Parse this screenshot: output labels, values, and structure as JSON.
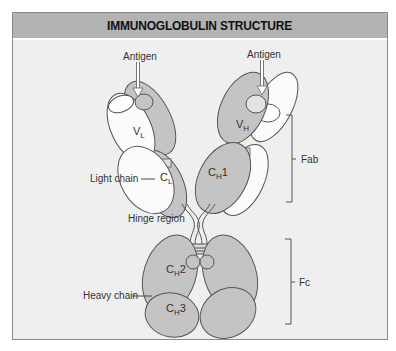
{
  "title": "IMMUNOGLOBULIN STRUCTURE",
  "labels": {
    "antigen_left": "Antigen",
    "antigen_right": "Antigen",
    "vl": "V",
    "vl_sub": "L",
    "vh": "V",
    "vh_sub": "H",
    "cl": "C",
    "cl_sub": "L",
    "ch1": "C",
    "ch1_sub": "H",
    "ch1_num": "1",
    "ch2": "C",
    "ch2_sub": "H",
    "ch2_num": "2",
    "ch3": "C",
    "ch3_sub": "H",
    "ch3_num": "3",
    "light_chain": "Light chain",
    "hinge_region": "Hinge region",
    "heavy_chain": "Heavy chain",
    "fab": "Fab",
    "fc": "Fc"
  },
  "colors": {
    "background": "#efefef",
    "header": "#b3b3b3",
    "heavy_chain_fill": "#c4c4c4",
    "light_chain_fill": "#fbfbfb",
    "outline": "#555555"
  }
}
